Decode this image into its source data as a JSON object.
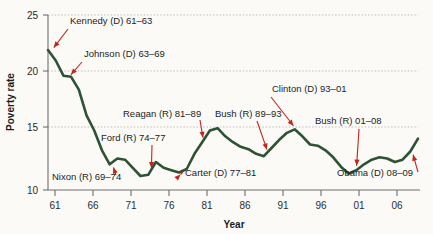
{
  "chart_data": {
    "type": "line",
    "title": "",
    "xlabel": "Year",
    "ylabel": "Poverty rate",
    "xlim": [
      61,
      109
    ],
    "ylim": [
      10,
      25
    ],
    "grid": true,
    "legend_position": "none",
    "line_color": "#2d5234",
    "annotation_color": "#c0261c",
    "xticks": [
      "61",
      "66",
      "71",
      "76",
      "81",
      "86",
      "91",
      "96",
      "01",
      "06"
    ],
    "xtick_values": [
      61,
      66,
      71,
      76,
      81,
      86,
      91,
      96,
      101,
      106
    ],
    "yticks": [
      "10",
      "15",
      "20",
      "25"
    ],
    "ytick_values": [
      10,
      15,
      20,
      25
    ],
    "series": [
      {
        "name": "Poverty rate",
        "x": [
          61,
          62,
          63,
          64,
          65,
          66,
          67,
          68,
          69,
          70,
          71,
          72,
          73,
          74,
          75,
          76,
          77,
          78,
          79,
          80,
          81,
          82,
          83,
          84,
          85,
          86,
          87,
          88,
          89,
          90,
          91,
          92,
          93,
          94,
          95,
          96,
          97,
          98,
          99,
          100,
          101,
          102,
          103,
          104,
          105,
          106,
          107,
          108,
          109
        ],
        "values": [
          22.0,
          21.1,
          19.8,
          19.7,
          18.6,
          16.4,
          15.1,
          13.4,
          12.2,
          12.7,
          12.6,
          11.9,
          11.2,
          11.3,
          12.4,
          11.9,
          11.7,
          11.5,
          11.8,
          13.1,
          14.1,
          15.1,
          15.3,
          14.6,
          14.1,
          13.7,
          13.5,
          13.1,
          12.9,
          13.6,
          14.3,
          14.9,
          15.2,
          14.6,
          13.9,
          13.8,
          13.4,
          12.8,
          12.0,
          11.4,
          11.7,
          12.2,
          12.6,
          12.8,
          12.7,
          12.4,
          12.6,
          13.3,
          14.4
        ]
      }
    ],
    "annotations": [
      {
        "id": "kennedy",
        "label": "Kennedy (D) 61–63",
        "target_x": 61.4,
        "target_y": 21.9
      },
      {
        "id": "johnson",
        "label": "Johnson (D) 63–69",
        "target_x": 63.6,
        "target_y": 19.6
      },
      {
        "id": "nixon",
        "label": "Nixon (R) 69–74",
        "target_x": 69.3,
        "target_y": 12.3
      },
      {
        "id": "ford",
        "label": "Ford (R) 74–77",
        "target_x": 74.4,
        "target_y": 11.5
      },
      {
        "id": "reagan",
        "label": "Reagan (R) 81–89",
        "target_x": 81.2,
        "target_y": 14.1
      },
      {
        "id": "carter",
        "label": "Carter (D) 77–81",
        "target_x": 78.6,
        "target_y": 11.6
      },
      {
        "id": "bush41",
        "label": "Bush (R) 89–93",
        "target_x": 89.6,
        "target_y": 13.1
      },
      {
        "id": "clinton",
        "label": "Clinton (D) 93–01",
        "target_x": 93.2,
        "target_y": 15.2
      },
      {
        "id": "bush43",
        "label": "Bush (R) 01–08",
        "target_x": 101.0,
        "target_y": 11.7
      },
      {
        "id": "obama",
        "label": "Obama (D) 08–09",
        "target_x": 108.2,
        "target_y": 13.4
      }
    ]
  }
}
